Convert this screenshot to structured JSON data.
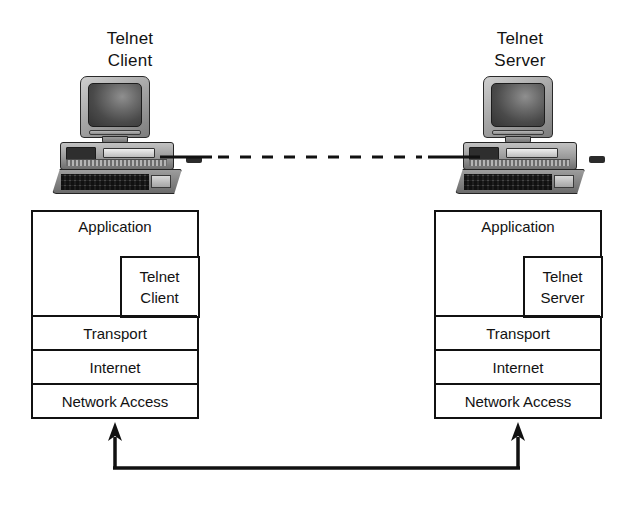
{
  "diagram": {
    "background_color": "#ffffff",
    "line_color": "#111111"
  },
  "hosts": [
    {
      "id": "client",
      "label": "Telnet\nClient",
      "computer_icon": "desktop-computer-icon"
    },
    {
      "id": "server",
      "label": "Telnet\nServer",
      "computer_icon": "desktop-computer-icon"
    }
  ],
  "stacks": {
    "client": {
      "layers": [
        {
          "name": "Application",
          "label": "Application"
        },
        {
          "name": "Transport",
          "label": "Transport"
        },
        {
          "name": "Internet",
          "label": "Internet"
        },
        {
          "name": "Network Access",
          "label": "Network Access"
        }
      ],
      "application_sublayer": {
        "label": "Telnet\nClient"
      }
    },
    "server": {
      "layers": [
        {
          "name": "Application",
          "label": "Application"
        },
        {
          "name": "Transport",
          "label": "Transport"
        },
        {
          "name": "Internet",
          "label": "Internet"
        },
        {
          "name": "Network Access",
          "label": "Network Access"
        }
      ],
      "application_sublayer": {
        "label": "Telnet\nServer"
      }
    }
  },
  "connections": {
    "logical_link": {
      "name": "logical-telnet-connection",
      "style": "dashed",
      "color": "#111111",
      "from": "client-computer",
      "to": "server-computer"
    },
    "physical_path": {
      "name": "physical-network-path",
      "style": "solid",
      "color": "#111111",
      "shape": "u-shaped",
      "arrowheads": "both-ends-up",
      "from": "client-network-access",
      "to": "server-network-access"
    }
  }
}
